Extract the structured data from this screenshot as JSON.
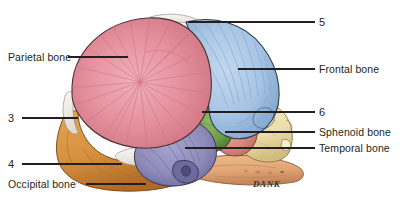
{
  "figure": {
    "signature": "DANK",
    "background_color": "#ffffff",
    "line_color": "#231f20"
  },
  "labels": {
    "left": [
      {
        "id": "parietal",
        "text": "Parietal bone",
        "leader_from_x": 68,
        "leader_to_x": 128,
        "leader_y": 57
      },
      {
        "id": "three",
        "text": "3",
        "leader_from_x": 22,
        "leader_to_x": 78,
        "leader_y": 118
      },
      {
        "id": "four",
        "text": "4",
        "leader_from_x": 22,
        "leader_to_x": 122,
        "leader_y": 164
      },
      {
        "id": "occipital",
        "text": "Occipital bone",
        "leader_from_x": 86,
        "leader_to_x": 146,
        "leader_y": 184
      }
    ],
    "right": [
      {
        "id": "five",
        "text": "5",
        "leader_from_x": 188,
        "leader_to_x": 315,
        "leader_y": 22
      },
      {
        "id": "frontal",
        "text": "Frontal bone",
        "leader_from_x": 238,
        "leader_to_x": 315,
        "leader_y": 69
      },
      {
        "id": "six",
        "text": "6",
        "leader_from_x": 202,
        "leader_to_x": 315,
        "leader_y": 112
      },
      {
        "id": "sphenoid",
        "text": "Sphenoid bone",
        "leader_from_x": 225,
        "leader_to_x": 315,
        "leader_y": 132
      },
      {
        "id": "temporal",
        "text": "Temporal bone",
        "leader_from_x": 185,
        "leader_to_x": 315,
        "leader_y": 148
      }
    ]
  },
  "bones": [
    {
      "name": "Parietal bone",
      "color": "#e5919d",
      "shade_color": "#d4717f",
      "outline": "#4a3336",
      "callout": "Parietal bone"
    },
    {
      "name": "Frontal bone",
      "color": "#a9c5e4",
      "shade_color": "#7ea4cd",
      "outline": "#2e3a4a",
      "callout": "Frontal bone"
    },
    {
      "name": "Temporal bone",
      "color": "#8f8cba",
      "shade_color": "#6f6ca0",
      "outline": "#3a3755",
      "callout": "Temporal bone"
    },
    {
      "name": "Sphenoid bone",
      "color": "#6d9e49",
      "shade_color": "#4f7c32",
      "outline": "#2f4a1e",
      "callout": "Sphenoid bone"
    },
    {
      "name": "Occipital bone",
      "color": "#d6913f",
      "shade_color": "#b6702a",
      "outline": "#6b4418",
      "callout": "Occipital bone"
    },
    {
      "name": "Maxilla",
      "color": "#eddfae",
      "shade_color": "#d8c487",
      "outline": "#8a7741",
      "callout": ""
    },
    {
      "name": "Mandible",
      "color": "#e3a878",
      "shade_color": "#cb8c58",
      "outline": "#8a5a32",
      "callout": ""
    },
    {
      "name": "Zygomatic region",
      "color": "#d9897f",
      "shade_color": "#c06b60",
      "outline": "#7d4038",
      "callout": ""
    },
    {
      "name": "Fontanelle membrane",
      "color": "#f5f2ee",
      "shade_color": "#e2ddd6",
      "outline": "#9a948c",
      "callout": ""
    }
  ],
  "unlabeled_callouts": {
    "three": "3",
    "four": "4",
    "five": "5",
    "six": "6"
  }
}
